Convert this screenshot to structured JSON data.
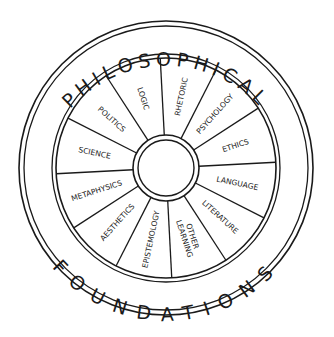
{
  "diagram": {
    "title_top": "PHILOSOPHICAL",
    "title_bottom": "FOUNDATIONS",
    "center": {
      "x": 166,
      "y": 168
    },
    "radii": {
      "outer1": 147,
      "outer2": 142,
      "inner1": 114,
      "inner2": 110,
      "hub1": 33,
      "hub2": 28
    },
    "spoke_start_angle_deg": -93,
    "sector_count": 12,
    "sectors": [
      {
        "label": "RHETORIC",
        "lines": [
          "RHETORIC"
        ]
      },
      {
        "label": "PSYCHOLOGY",
        "lines": [
          "PSYCHOLOGY"
        ]
      },
      {
        "label": "ETHICS",
        "lines": [
          "ETHICS"
        ]
      },
      {
        "label": "LANGUAGE",
        "lines": [
          "LANGUAGE"
        ]
      },
      {
        "label": "LITERATURE",
        "lines": [
          "LITERATURE"
        ]
      },
      {
        "label": "OTHER LEARNING",
        "lines": [
          "OTHER",
          "LEARNING"
        ]
      },
      {
        "label": "EPISTEMOLOGY",
        "lines": [
          "EPISTEMOLOGY"
        ]
      },
      {
        "label": "AESTHETICS",
        "lines": [
          "AESTHETICS"
        ]
      },
      {
        "label": "METAPHYSICS",
        "lines": [
          "METAPHYSICS"
        ]
      },
      {
        "label": "SCIENCE",
        "lines": [
          "SCIENCE"
        ]
      },
      {
        "label": "POLITICS",
        "lines": [
          "POLITICS"
        ]
      },
      {
        "label": "LOGIC",
        "lines": [
          "LOGIC"
        ]
      }
    ],
    "colors": {
      "ink": "#1a1a1a",
      "background": "#ffffff"
    }
  }
}
